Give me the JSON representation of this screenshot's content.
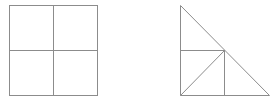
{
  "figures": [
    {
      "name": "square-divided-into-four",
      "shape": "square",
      "bounds": {
        "x1": 9.5,
        "y1": 5.5,
        "x2": 97.5,
        "y2": 95.5
      },
      "lines": [
        {
          "x1": 53.5,
          "y1": 5.5,
          "x2": 53.5,
          "y2": 95.5
        },
        {
          "x1": 9.5,
          "y1": 50.5,
          "x2": 97.5,
          "y2": 50.5
        }
      ]
    },
    {
      "name": "right-triangle-subdivided",
      "shape": "right-triangle",
      "vertices": [
        [
          180.5,
          5.5
        ],
        [
          180.5,
          95.5
        ],
        [
          269.5,
          95.5
        ]
      ],
      "inner_point": [
        224.5,
        50.5
      ],
      "lines": [
        {
          "x1": 180.5,
          "y1": 50.5,
          "x2": 224.5,
          "y2": 50.5
        },
        {
          "x1": 224.5,
          "y1": 50.5,
          "x2": 224.5,
          "y2": 95.5
        },
        {
          "x1": 180.5,
          "y1": 95.5,
          "x2": 224.5,
          "y2": 50.5
        }
      ]
    }
  ],
  "colors": {
    "stroke": "#8c8c8c",
    "background": "#ffffff"
  }
}
